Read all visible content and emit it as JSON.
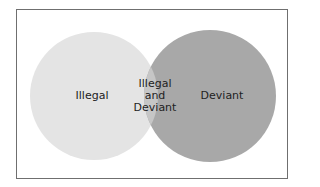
{
  "diagram": {
    "type": "venn",
    "sets": [
      {
        "label": "Illegal",
        "color": "#e4e4e4"
      },
      {
        "label": "Deviant",
        "color": "#a6a6a6"
      }
    ],
    "intersection": {
      "line1": "Illegal",
      "line2": "and",
      "line3": "Deviant",
      "color": "#c4c4c4"
    }
  }
}
